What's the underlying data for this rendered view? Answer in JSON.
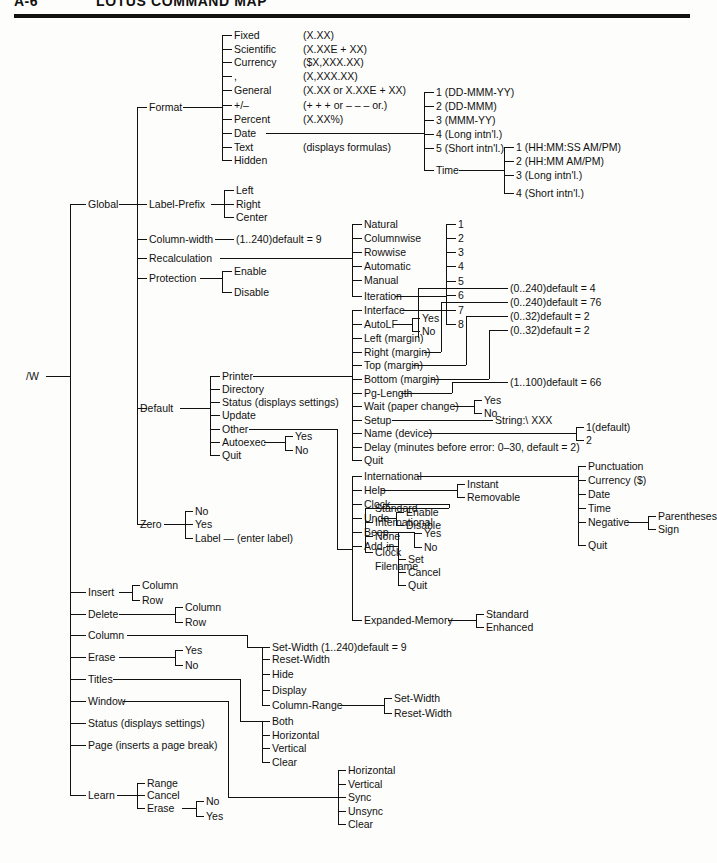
{
  "header": {
    "folio": "A-6",
    "title": "LOTUS COMMAND MAP"
  },
  "diagram": {
    "type": "tree",
    "root": "/W",
    "nodes": {
      "root": "/W",
      "global": "Global",
      "format": "Format",
      "fmt_fixed": "Fixed",
      "fmt_fixed_v": "(X.XX)",
      "fmt_scientific": "Scientific",
      "fmt_scientific_v": "(X.XXE + XX)",
      "fmt_currency": "Currency",
      "fmt_currency_v": "($X,XXX.XX)",
      "fmt_comma": ",",
      "fmt_comma_v": "(X,XXX.XX)",
      "fmt_general": "General",
      "fmt_general_v": "(X.XX or X.XXE + XX)",
      "fmt_plusminus": "+/–",
      "fmt_plusminus_v": "(+ + + or – – – or.)",
      "fmt_percent": "Percent",
      "fmt_percent_v": "(X.XX%)",
      "fmt_date": "Date",
      "fmt_text": "Text",
      "fmt_text_v": "(displays formulas)",
      "fmt_hidden": "Hidden",
      "date_1": "1 (DD-MMM-YY)",
      "date_2": "2 (DD-MMM)",
      "date_3": "3 (MMM-YY)",
      "date_4": "4 (Long intn'l.)",
      "date_5": "5 (Short intn'l.)",
      "date_time": "Time",
      "time_1": "1 (HH:MM:SS AM/PM)",
      "time_2": "2 (HH:MM AM/PM)",
      "time_3": "3 (Long intn'l.)",
      "time_4": "4 (Short intn'l.)",
      "label_prefix": "Label-Prefix",
      "lp_left": "Left",
      "lp_right": "Right",
      "lp_center": "Center",
      "column_width": "Column-width",
      "cw_value": "(1..240)default = 9",
      "recalculation": "Recalculation",
      "rc_natural": "Natural",
      "rc_columnwise": "Columnwise",
      "rc_rowwise": "Rowwise",
      "rc_automatic": "Automatic",
      "rc_manual": "Manual",
      "rc_iteration": "Iteration",
      "it_1": "1",
      "it_2": "2",
      "it_3": "3",
      "it_4": "4",
      "it_5": "5",
      "it_6": "6",
      "it_7": "7",
      "it_8": "8",
      "protection": "Protection",
      "pr_enable": "Enable",
      "pr_disable": "Disable",
      "default": "Default",
      "df_printer": "Printer",
      "df_directory": "Directory",
      "df_status": "Status (displays settings)",
      "df_update": "Update",
      "df_other": "Other",
      "df_autoexec": "Autoexec",
      "ae_yes": "Yes",
      "ae_no": "No",
      "df_quit": "Quit",
      "pr_interface": "Interface",
      "pr_autolf": "AutoLF",
      "alf_yes": "Yes",
      "alf_no": "No",
      "pr_left": "Left (margin)",
      "pr_right": "Right (margin)",
      "pr_top": "Top (margin)",
      "pr_bottom": "Bottom (margin)",
      "pr_pglength": "Pg-Length",
      "pr_wait": "Wait (paper change)",
      "wt_yes": "Yes",
      "wt_no": "No",
      "pr_setup": "Setup",
      "pr_setup_v": "String:\\ XXX",
      "pr_name": "Name (device)",
      "nm_1": "1(default)",
      "nm_2": "2",
      "pr_delay": "Delay (minutes before error: 0–30, default = 2)",
      "pr_quit": "Quit",
      "mg_left_v": "(0..240)default = 4",
      "mg_right_v": "(0..240)default = 76",
      "mg_top_v": "(0..32)default = 2",
      "mg_bottom_v": "(0..32)default = 2",
      "mg_pglength_v": "(1..100)default = 66",
      "ot_international": "International",
      "ot_help": "Help",
      "hp_instant": "Instant",
      "hp_removable": "Removable",
      "ot_clock": "Clock",
      "ot_undo": "Undo",
      "un_enable": "Enable",
      "un_disable": "Disable",
      "ot_beep": "Beep",
      "bp_yes": "Yes",
      "bp_no": "No",
      "ot_addin": "Add-in",
      "ai_set": "Set",
      "ai_cancel": "Cancel",
      "ai_quit": "Quit",
      "ck_standard": "Standard",
      "ck_international": "International",
      "ck_none": "None",
      "ck_clock": "Clock",
      "ck_filename": "Filename",
      "in_punctuation": "Punctuation",
      "in_currency": "Currency ($)",
      "in_date": "Date",
      "in_time": "Time",
      "in_negative": "Negative",
      "ng_parentheses": "Parentheses",
      "ng_sign": "Sign",
      "in_quit": "Quit",
      "ot_expmem": "Expanded-Memory",
      "em_standard": "Standard",
      "em_enhanced": "Enhanced",
      "zero": "Zero",
      "z_no": "No",
      "z_yes": "Yes",
      "z_label": "Label — (enter label)",
      "insert": "Insert",
      "ins_column": "Column",
      "ins_row": "Row",
      "delete": "Delete",
      "del_column": "Column",
      "del_row": "Row",
      "column": "Column",
      "erase": "Erase",
      "er_yes": "Yes",
      "er_no": "No",
      "titles": "Titles",
      "window": "Window",
      "status": "Status (displays settings)",
      "page": "Page (inserts a page break)",
      "learn": "Learn",
      "ln_range": "Range",
      "ln_cancel": "Cancel",
      "ln_erase": "Erase",
      "le_no": "No",
      "le_yes": "Yes",
      "col_setwidth": "Set-Width (1..240)default = 9",
      "col_resetwidth": "Reset-Width",
      "col_hide": "Hide",
      "col_display": "Display",
      "col_range": "Column-Range",
      "cr_setwidth": "Set-Width",
      "cr_resetwidth": "Reset-Width",
      "ti_both": "Both",
      "ti_horizontal": "Horizontal",
      "ti_vertical": "Vertical",
      "ti_clear": "Clear",
      "wn_horizontal": "Horizontal",
      "wn_vertical": "Vertical",
      "wn_sync": "Sync",
      "wn_unsync": "Unsync",
      "wn_clear": "Clear"
    }
  }
}
